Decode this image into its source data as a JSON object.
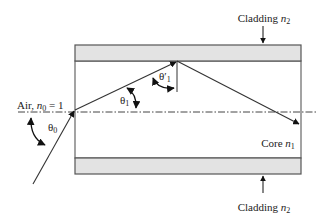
{
  "diagram": {
    "labels": {
      "cladding_top": {
        "text": "Cladding ",
        "var": "n",
        "sub": "2"
      },
      "cladding_bottom": {
        "text": "Cladding ",
        "var": "n",
        "sub": "2"
      },
      "core": {
        "text": "Core ",
        "var": "n",
        "sub": "1"
      },
      "air": {
        "text": "Air, ",
        "var": "n",
        "sub": "0",
        "suffix": " = 1"
      }
    },
    "angles": {
      "theta0": {
        "sym": "θ",
        "sub": "0"
      },
      "theta1": {
        "sym": "θ",
        "sub": "1"
      },
      "theta1_prime": {
        "sym": "θ′",
        "sub": "1"
      }
    },
    "colors": {
      "cladding_fill": "#e3e3e3",
      "stroke": "#555555",
      "ray": "#333333",
      "text": "#222222"
    }
  }
}
